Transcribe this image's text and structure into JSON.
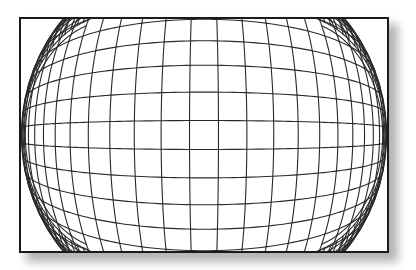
{
  "figure": {
    "frame": {
      "x": 19,
      "y": 17,
      "width": 370,
      "height": 236
    },
    "grid": {
      "spacing": 29,
      "distortion_k": 7.5e-06,
      "line_color": "#2a2a2a",
      "border_color": "#1a1a1a",
      "background": "#ffffff"
    },
    "shadow": {
      "offset_x": 7,
      "offset_y": 8,
      "color": "#9a9a9a"
    }
  }
}
